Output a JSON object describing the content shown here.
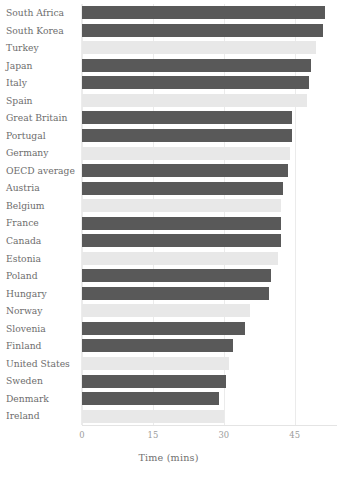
{
  "chart_data": {
    "type": "bar",
    "orientation": "horizontal",
    "title": "",
    "xlabel": "Time (mins)",
    "ylabel": "",
    "xlim": [
      0,
      63
    ],
    "xticks": [
      0,
      15,
      30,
      45,
      60
    ],
    "xtick_labels": [
      "0",
      "15",
      "30",
      "45",
      "60"
    ],
    "grid": true,
    "legend": "none",
    "categories": [
      "South Africa",
      "South Korea",
      "Turkey",
      "Japan",
      "Italy",
      "Spain",
      "Great Britain",
      "Portugal",
      "Germany",
      "OECD average",
      "Austria",
      "Belgium",
      "France",
      "Canada",
      "Estonia",
      "Poland",
      "Hungary",
      "Norway",
      "Slovenia",
      "Finland",
      "United States",
      "Sweden",
      "Denmark",
      "Ireland"
    ],
    "values": [
      51.5,
      51.0,
      49.5,
      48.5,
      48.0,
      47.5,
      44.5,
      44.5,
      44.0,
      43.5,
      42.5,
      42.0,
      42.0,
      42.0,
      41.5,
      40.0,
      39.5,
      35.5,
      34.5,
      32.0,
      31.0,
      30.5,
      29.0,
      30.0
    ],
    "bar_colors": [
      "#595959",
      "#595959",
      "#e8e8e8",
      "#595959",
      "#595959",
      "#e8e8e8",
      "#595959",
      "#595959",
      "#e8e8e8",
      "#595959",
      "#595959",
      "#e8e8e8",
      "#595959",
      "#595959",
      "#e8e8e8",
      "#595959",
      "#595959",
      "#e8e8e8",
      "#595959",
      "#595959",
      "#e8e8e8",
      "#595959",
      "#595959",
      "#e8e8e8"
    ]
  },
  "style": {
    "bar_dark": "#595959",
    "bar_light": "#e8e8e8",
    "grid_color": "#ebebeb",
    "label_color": "#6d6d6d",
    "tick_color": "#9b9b9b",
    "axis_title_color": "#707070",
    "background": "#ffffff"
  }
}
